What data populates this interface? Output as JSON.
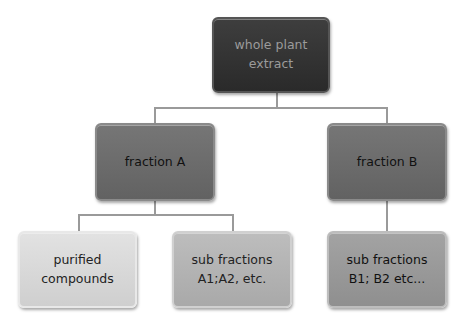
{
  "diagram": {
    "type": "hierarchy",
    "root": {
      "label": "whole plant\nextract"
    },
    "level1": [
      {
        "label": "fraction A"
      },
      {
        "label": "fraction B"
      }
    ],
    "level2": [
      {
        "label": "purified\ncompounds",
        "parent": "fraction A"
      },
      {
        "label": "sub fractions\nA1;A2, etc.",
        "parent": "fraction A"
      },
      {
        "label": "sub fractions\nB1; B2 etc...",
        "parent": "fraction B"
      }
    ]
  }
}
